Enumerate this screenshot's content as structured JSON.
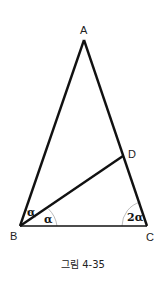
{
  "diagram": {
    "vertices": {
      "A": {
        "label": "A",
        "x": 84,
        "y": 40
      },
      "B": {
        "label": "B",
        "x": 20,
        "y": 226
      },
      "C": {
        "label": "C",
        "x": 147,
        "y": 226
      },
      "D": {
        "label": "D",
        "x": 123,
        "y": 156
      }
    },
    "edges": [
      {
        "from": "A",
        "to": "B"
      },
      {
        "from": "A",
        "to": "C"
      },
      {
        "from": "B",
        "to": "C"
      },
      {
        "from": "B",
        "to": "D"
      }
    ],
    "angles": [
      {
        "at": "B",
        "between": [
          "A",
          "D"
        ],
        "label": "α"
      },
      {
        "at": "B",
        "between": [
          "D",
          "C"
        ],
        "label": "α"
      },
      {
        "at": "C",
        "between": [
          "B",
          "A"
        ],
        "label": "2α"
      }
    ],
    "caption": "그림 4-35"
  }
}
